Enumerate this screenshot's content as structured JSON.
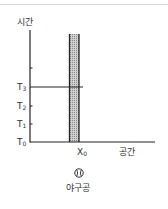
{
  "diagram": {
    "type": "spacetime-diagram",
    "y_axis": {
      "label": "시간"
    },
    "x_axis": {
      "label": "공간"
    },
    "time_ticks": [
      {
        "label": "T",
        "sub": "0",
        "y": 142
      },
      {
        "label": "T",
        "sub": "1",
        "y": 124
      },
      {
        "label": "T",
        "sub": "2",
        "y": 106
      },
      {
        "label": "T",
        "sub": "3",
        "y": 87
      }
    ],
    "unlabeled_tick_y": 68,
    "position_marker": {
      "label": "X",
      "sub": "0"
    },
    "worldline": {
      "description": "shaded vertical band at X0",
      "fill": "#bdbdbd"
    },
    "t3_line": {
      "description": "horizontal line at T3 crossing the band"
    },
    "object": {
      "icon": "baseball-icon",
      "label": "야구공"
    }
  }
}
